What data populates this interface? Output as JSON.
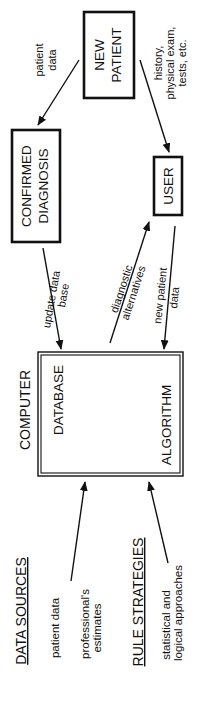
{
  "diagram": {
    "orientation": "rotated 90deg counter-clockwise",
    "nodes": {
      "new_patient": {
        "line1": "NEW",
        "line2": "PATIENT"
      },
      "confirmed_diagnosis": {
        "line1": "CONFIRMED",
        "line2": "DIAGNOSIS"
      },
      "user": {
        "label": "USER"
      },
      "computer": {
        "title": "COMPUTER",
        "database": "DATABASE",
        "algorithm": "ALGORITHM"
      }
    },
    "edges": {
      "patient_data": {
        "line1": "patient",
        "line2": "data",
        "from": "NEW PATIENT",
        "to": "CONFIRMED DIAGNOSIS"
      },
      "history": {
        "line1": "history,",
        "line2": "physical exam,",
        "line3": "tests, etc.",
        "from": "NEW PATIENT",
        "to": "USER"
      },
      "update_db": {
        "line1": "update data",
        "line2": "base",
        "from": "CONFIRMED DIAGNOSIS",
        "to": "DATABASE"
      },
      "diag_alt": {
        "line1": "diagnostic",
        "line2": "alternatives",
        "from": "COMPUTER",
        "to": "USER"
      },
      "new_patient_data": {
        "line1": "new patient",
        "line2": "data",
        "from": "USER",
        "to": "ALGORITHM"
      }
    },
    "sources": {
      "data_sources": {
        "heading": "DATA SOURCES",
        "items": [
          "patient data",
          "professional's",
          "estimates"
        ]
      },
      "rule_strategies": {
        "heading": "RULE STRATEGIES",
        "items": [
          "statistical and",
          "logical approaches"
        ]
      }
    }
  }
}
